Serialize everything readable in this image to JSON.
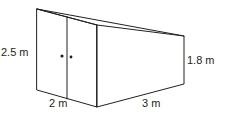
{
  "figure": {
    "type": "3D shed / trapezoidal prism diagram",
    "labels": {
      "left_height": "2.5 m",
      "right_height": "1.8 m",
      "width": "2 m",
      "length": "3 m"
    },
    "colors": {
      "line": "#231f20",
      "background": "#ffffff"
    }
  }
}
